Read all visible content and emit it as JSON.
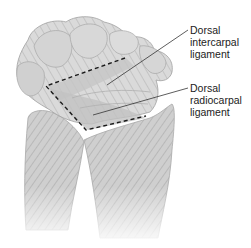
{
  "figure": {
    "background": "#ffffff",
    "bone_color": "#c9c9c9",
    "outline_color": "#9a9a9a",
    "ligament_outline_color": "#1a1a1a"
  },
  "labels": [
    {
      "id": "dorsal-intercarpal-ligament",
      "text": "Dorsal\nintercarpal\nligament"
    },
    {
      "id": "dorsal-radiocarpal-ligament",
      "text": "Dorsal\nradiocarpal\nligament"
    }
  ]
}
